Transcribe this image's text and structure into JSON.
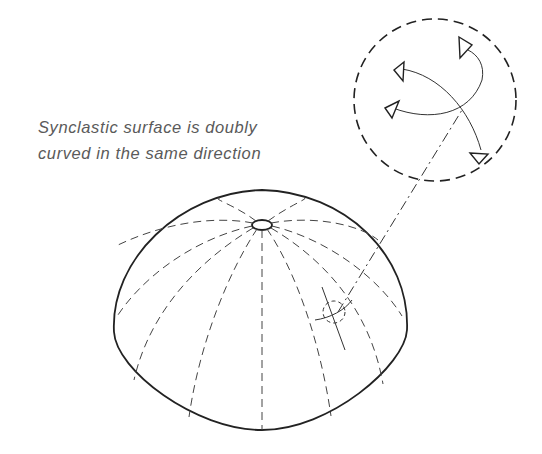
{
  "caption": {
    "line1": "Synclastic surface is doubly",
    "line2": "curved in the same direction"
  },
  "figure": {
    "detail_callout": "circular magnified detail showing two curvature arrows",
    "colors": {
      "ink": "#222222",
      "background": "#ffffff",
      "caption_text": "#5a5a5a"
    }
  }
}
